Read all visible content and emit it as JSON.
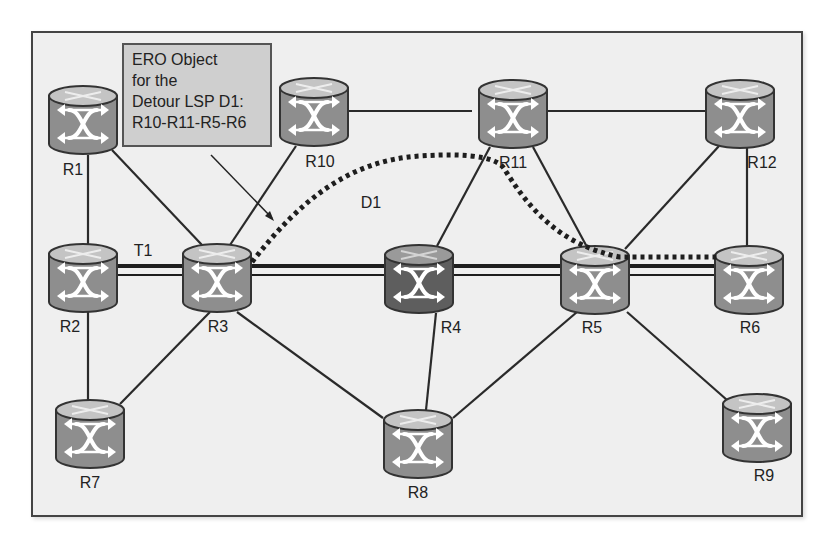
{
  "diagram": {
    "type": "network-topology",
    "annotation_box": {
      "lines": [
        "ERO Object",
        "for the",
        "Detour LSP D1:",
        "R10-R11-R5-R6"
      ]
    },
    "path_labels": {
      "tunnel": "T1",
      "detour": "D1"
    },
    "routers": [
      {
        "id": "R1",
        "label": "R1",
        "x": 83,
        "y": 120,
        "shade": "normal"
      },
      {
        "id": "R2",
        "label": "R2",
        "x": 83,
        "y": 278,
        "shade": "normal"
      },
      {
        "id": "R3",
        "label": "R3",
        "x": 217,
        "y": 278,
        "shade": "normal"
      },
      {
        "id": "R4",
        "label": "R4",
        "x": 419,
        "y": 278,
        "shade": "dark"
      },
      {
        "id": "R5",
        "label": "R5",
        "x": 595,
        "y": 280,
        "shade": "normal"
      },
      {
        "id": "R6",
        "label": "R6",
        "x": 749,
        "y": 280,
        "shade": "normal"
      },
      {
        "id": "R7",
        "label": "R7",
        "x": 90,
        "y": 434,
        "shade": "normal"
      },
      {
        "id": "R8",
        "label": "R8",
        "x": 418,
        "y": 444,
        "shade": "normal"
      },
      {
        "id": "R9",
        "label": "R9",
        "x": 757,
        "y": 428,
        "shade": "normal"
      },
      {
        "id": "R10",
        "label": "R10",
        "x": 314,
        "y": 113,
        "shade": "normal"
      },
      {
        "id": "R11",
        "label": "R11",
        "x": 513,
        "y": 114,
        "shade": "normal"
      },
      {
        "id": "R12",
        "label": "R12",
        "x": 740,
        "y": 114,
        "shade": "normal"
      }
    ],
    "links": [
      [
        "R1",
        "R2"
      ],
      [
        "R1",
        "R3"
      ],
      [
        "R2",
        "R7"
      ],
      [
        "R3",
        "R7"
      ],
      [
        "R3",
        "R10"
      ],
      [
        "R3",
        "R8"
      ],
      [
        "R10",
        "R11"
      ],
      [
        "R11",
        "R12"
      ],
      [
        "R11",
        "R4"
      ],
      [
        "R11",
        "R5"
      ],
      [
        "R12",
        "R5"
      ],
      [
        "R12",
        "R6"
      ],
      [
        "R4",
        "R8"
      ],
      [
        "R5",
        "R8"
      ],
      [
        "R5",
        "R9"
      ]
    ],
    "tunnel_T1_path": [
      "R2",
      "R3",
      "R4",
      "R5",
      "R6"
    ],
    "detour_D1_path": [
      "R3",
      "R10-area",
      "R11",
      "R5",
      "R6"
    ],
    "colors": {
      "frame_bg": "#efefef",
      "router_body": "#8e8e8e",
      "router_top": "#c4c4c4",
      "router_dark_body": "#5e5e5e",
      "router_dark_top": "#9a9a9a",
      "link": "#2a2a2a",
      "annotation_bg": "#cfcfcf"
    }
  }
}
